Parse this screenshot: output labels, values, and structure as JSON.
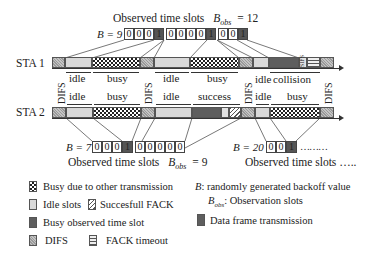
{
  "top": {
    "observed_label": "Observed time slots",
    "bobs_symbol": "B",
    "bobs_sub": "obs",
    "bobs_value": "= 12",
    "b_label": "B = 9",
    "slots": [
      "0",
      "0",
      "0",
      "1",
      "0",
      "0",
      "0",
      "0",
      "1",
      "0",
      "0",
      "1"
    ]
  },
  "sta1": {
    "label": "STA 1",
    "segments": [
      "DIFS",
      "idle",
      "busy",
      "DIFS",
      "idle",
      "busy",
      "DIFS",
      "idle",
      "collision",
      "SIFS",
      "FACK timeout",
      "DIFS"
    ],
    "labels": {
      "idle1": "idle",
      "busy1": "busy",
      "idle2": "idle",
      "busy2": "busy",
      "idle3": "idle",
      "collision": "collision",
      "sifs": "SIFS"
    }
  },
  "sta2": {
    "label": "STA 2",
    "labels": {
      "idle1": "idle",
      "busy1": "busy",
      "idle2": "idle",
      "success": "success",
      "idle3": "idle",
      "busy2": "busy"
    }
  },
  "difs_label": "DIFS",
  "bottom": {
    "b7_label": "B = 7",
    "b7_slots": [
      "0",
      "0",
      "0",
      "1",
      "0",
      "0",
      "0",
      "0",
      "0"
    ],
    "observed_label": "Observed time slots",
    "bobs_symbol": "B",
    "bobs_sub": "obs",
    "bobs_value": "= 9",
    "b20_label": "B = 20",
    "b20_slots": [
      "0",
      "0",
      "1"
    ],
    "b20_more": "………",
    "observed2_label": "Observed time slots ….."
  },
  "legend": {
    "busy_other": "Busy due to other transmission",
    "idle": "Idle slots",
    "fack": "Succesfull FACK",
    "busy_observed": "Busy observed time slot",
    "difs": "DIFS",
    "fack_timeout": "FACK timeout",
    "b_def_sym": "B",
    "b_def": ": randomly generated backoff value",
    "bobs_def_sym": "B",
    "bobs_def_sub": "obs",
    "bobs_def": ": Observation slots",
    "data_frame": "Data frame transmission"
  },
  "colors": {
    "data": "#5e5e5e",
    "idle": "#d9d9d9",
    "line": "#333333"
  }
}
